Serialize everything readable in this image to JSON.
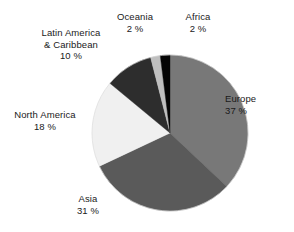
{
  "chart_data": {
    "type": "pie",
    "title": "",
    "xlabel": "",
    "ylabel": "",
    "unit": "%",
    "start_angle_deg": 0,
    "direction": "clockwise",
    "legend": "none",
    "grid": false,
    "labels_outside": true,
    "categories": [
      "Europe",
      "Asia",
      "North America",
      "Latin America & Caribbean",
      "Oceania",
      "Africa"
    ],
    "values": [
      37,
      31,
      18,
      10,
      2,
      2
    ],
    "colors": [
      "#787878",
      "#5a5a5a",
      "#f0f0f0",
      "#2d2d2d",
      "#bfbfbf",
      "#050505"
    ],
    "slices": [
      {
        "name": "Europe",
        "value": 37,
        "value_label": "37 %",
        "color": "#787878",
        "label_line1": "Europe",
        "label_line2": "37 %"
      },
      {
        "name": "Asia",
        "value": 31,
        "value_label": "31 %",
        "color": "#5a5a5a",
        "label_line1": "Asia",
        "label_line2": "31 %"
      },
      {
        "name": "North America",
        "value": 18,
        "value_label": "18 %",
        "color": "#f0f0f0",
        "label_line1": "North America",
        "label_line2": "18 %"
      },
      {
        "name": "Latin America & Caribbean",
        "value": 10,
        "value_label": "10 %",
        "color": "#2d2d2d",
        "label_line1": "Latin America",
        "label_line2": "& Caribbean",
        "label_line3": "10 %"
      },
      {
        "name": "Oceania",
        "value": 2,
        "value_label": "2 %",
        "color": "#bfbfbf",
        "label_line1": "Oceania",
        "label_line2": "2 %"
      },
      {
        "name": "Africa",
        "value": 2,
        "value_label": "2 %",
        "color": "#050505",
        "label_line1": "Africa",
        "label_line2": "2 %"
      }
    ],
    "geometry": {
      "center_x": 170,
      "center_y": 133,
      "radius": 78
    }
  }
}
